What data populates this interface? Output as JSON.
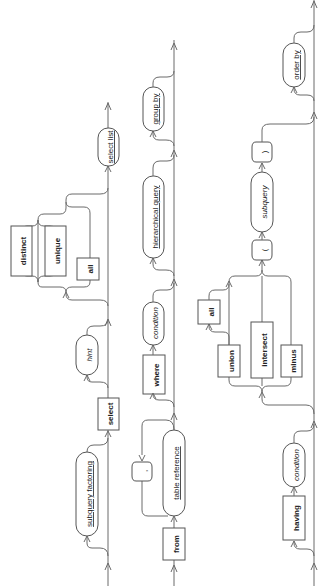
{
  "diagram": {
    "orientation": "rotated-90-ccw",
    "colors": {
      "line": "#6a6a6a",
      "box_border": "#555555",
      "background": "#ffffff",
      "text": "#222222"
    },
    "rows": [
      {
        "id": "row1",
        "elements": [
          {
            "id": "subquery-factoring",
            "type": "nonterminal",
            "label": "subquery factoring",
            "optional": true
          },
          {
            "id": "select-keyword",
            "type": "keyword",
            "label": "select"
          },
          {
            "id": "hint",
            "type": "placeholder",
            "label": "hint",
            "optional": true
          },
          {
            "id": "distinct-keyword",
            "type": "keyword",
            "label": "distinct"
          },
          {
            "id": "unique-keyword",
            "type": "keyword",
            "label": "unique"
          },
          {
            "id": "all-keyword",
            "type": "keyword",
            "label": "all"
          },
          {
            "id": "select-list",
            "type": "nonterminal",
            "label": "select list"
          }
        ]
      },
      {
        "id": "row2",
        "elements": [
          {
            "id": "from-keyword",
            "type": "keyword",
            "label": "from"
          },
          {
            "id": "table-reference",
            "type": "nonterminal",
            "label": "table reference"
          },
          {
            "id": "comma",
            "type": "symbol",
            "label": ","
          },
          {
            "id": "where-keyword",
            "type": "keyword",
            "label": "where"
          },
          {
            "id": "where-condition",
            "type": "placeholder",
            "label": "condition"
          },
          {
            "id": "hierarchical-query",
            "type": "nonterminal",
            "label": "hierarchical query"
          },
          {
            "id": "group-by",
            "type": "nonterminal",
            "label": "group by"
          }
        ]
      },
      {
        "id": "row3",
        "elements": [
          {
            "id": "having-keyword",
            "type": "keyword",
            "label": "having"
          },
          {
            "id": "having-condition",
            "type": "placeholder",
            "label": "condition"
          },
          {
            "id": "union-keyword",
            "type": "keyword",
            "label": "union"
          },
          {
            "id": "union-all-keyword",
            "type": "keyword",
            "label": "all"
          },
          {
            "id": "intersect-keyword",
            "type": "keyword",
            "label": "intersect"
          },
          {
            "id": "minus-keyword",
            "type": "keyword",
            "label": "minus"
          },
          {
            "id": "open-paren",
            "type": "symbol",
            "label": "("
          },
          {
            "id": "subquery",
            "type": "placeholder",
            "label": "subquery"
          },
          {
            "id": "close-paren",
            "type": "symbol",
            "label": ")"
          },
          {
            "id": "order-by",
            "type": "nonterminal",
            "label": "order by"
          }
        ]
      }
    ]
  }
}
